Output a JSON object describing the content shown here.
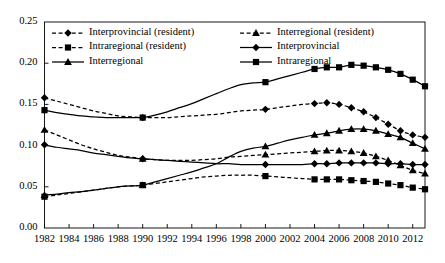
{
  "chart_data": {
    "type": "line",
    "title": "",
    "xlabel": "",
    "ylabel": "",
    "xlim": [
      1982,
      2013
    ],
    "ylim": [
      0.0,
      0.25
    ],
    "ytick_step": 0.05,
    "xtick_step": 2,
    "grid": false,
    "legend_position": "top-inside-two-columns",
    "ytick_labels": [
      "0.00",
      "0.05",
      "0.10",
      "0.15",
      "0.20",
      "0.25"
    ],
    "ytick_values": [
      0.0,
      0.05,
      0.1,
      0.15,
      0.2,
      0.25
    ],
    "xtick_labels": [
      "1982",
      "1984",
      "1986",
      "1988",
      "1990",
      "1992",
      "1994",
      "1996",
      "1998",
      "2000",
      "2002",
      "2004",
      "2006",
      "2008",
      "2010",
      "2012"
    ],
    "xtick_values": [
      1982,
      1984,
      1986,
      1988,
      1990,
      1992,
      1994,
      1996,
      1998,
      2000,
      2002,
      2004,
      2006,
      2008,
      2010,
      2012
    ],
    "x": [
      1982,
      1983,
      1984,
      1985,
      1986,
      1987,
      1988,
      1989,
      1990,
      1991,
      1992,
      1993,
      1994,
      1995,
      1996,
      1997,
      1998,
      1999,
      2000,
      2001,
      2002,
      2003,
      2004,
      2005,
      2006,
      2007,
      2008,
      2009,
      2010,
      2011,
      2012,
      2013
    ],
    "series": [
      {
        "name": "Interprovincial (resident)",
        "marker": "diamond",
        "line": "dashed",
        "color": "#000000",
        "values": [
          0.158,
          0.154,
          0.15,
          0.146,
          0.142,
          0.139,
          0.136,
          0.135,
          0.134,
          0.134,
          0.134,
          0.135,
          0.136,
          0.137,
          0.138,
          0.14,
          0.142,
          0.143,
          0.144,
          0.146,
          0.148,
          0.15,
          0.151,
          0.152,
          0.15,
          0.146,
          0.141,
          0.134,
          0.126,
          0.118,
          0.113,
          0.11
        ]
      },
      {
        "name": "Interregional (resident)",
        "marker": "triangle",
        "line": "dashed",
        "color": "#000000",
        "values": [
          0.119,
          0.113,
          0.107,
          0.101,
          0.096,
          0.092,
          0.088,
          0.086,
          0.084,
          0.083,
          0.082,
          0.082,
          0.082,
          0.083,
          0.084,
          0.086,
          0.087,
          0.088,
          0.089,
          0.09,
          0.091,
          0.092,
          0.093,
          0.094,
          0.094,
          0.093,
          0.091,
          0.087,
          0.082,
          0.076,
          0.07,
          0.066
        ]
      },
      {
        "name": "Intraregional (resident)",
        "marker": "square",
        "line": "dashed",
        "color": "#000000",
        "values": [
          0.038,
          0.04,
          0.042,
          0.044,
          0.046,
          0.048,
          0.05,
          0.051,
          0.052,
          0.054,
          0.056,
          0.058,
          0.06,
          0.062,
          0.063,
          0.064,
          0.064,
          0.064,
          0.063,
          0.062,
          0.061,
          0.06,
          0.059,
          0.059,
          0.059,
          0.058,
          0.057,
          0.056,
          0.054,
          0.052,
          0.049,
          0.047
        ]
      },
      {
        "name": "Interprovincial",
        "marker": "diamond",
        "line": "solid",
        "color": "#000000",
        "values": [
          0.101,
          0.098,
          0.096,
          0.094,
          0.091,
          0.089,
          0.087,
          0.085,
          0.084,
          0.083,
          0.082,
          0.081,
          0.08,
          0.079,
          0.078,
          0.078,
          0.077,
          0.077,
          0.077,
          0.077,
          0.077,
          0.077,
          0.078,
          0.078,
          0.079,
          0.079,
          0.079,
          0.079,
          0.078,
          0.078,
          0.077,
          0.077
        ]
      },
      {
        "name": "Interregional",
        "marker": "triangle",
        "line": "solid",
        "color": "#000000",
        "values": [
          0.04,
          0.041,
          0.043,
          0.044,
          0.046,
          0.048,
          0.05,
          0.051,
          0.052,
          0.056,
          0.06,
          0.064,
          0.068,
          0.073,
          0.078,
          0.086,
          0.093,
          0.097,
          0.099,
          0.103,
          0.107,
          0.11,
          0.113,
          0.115,
          0.118,
          0.12,
          0.12,
          0.118,
          0.114,
          0.11,
          0.103,
          0.096
        ]
      },
      {
        "name": "Intraregional",
        "marker": "square",
        "line": "solid",
        "color": "#000000",
        "values": [
          0.143,
          0.14,
          0.138,
          0.136,
          0.135,
          0.134,
          0.134,
          0.134,
          0.134,
          0.137,
          0.141,
          0.146,
          0.151,
          0.157,
          0.163,
          0.169,
          0.174,
          0.176,
          0.177,
          0.181,
          0.185,
          0.189,
          0.193,
          0.195,
          0.195,
          0.198,
          0.197,
          0.195,
          0.192,
          0.187,
          0.18,
          0.172
        ]
      }
    ],
    "legend_columns": [
      [
        "Interprovincial (resident)",
        "Intraregional (resident)",
        "Interregional"
      ],
      [
        "Interregional (resident)",
        "Interprovincial",
        "Intraregional"
      ]
    ]
  }
}
